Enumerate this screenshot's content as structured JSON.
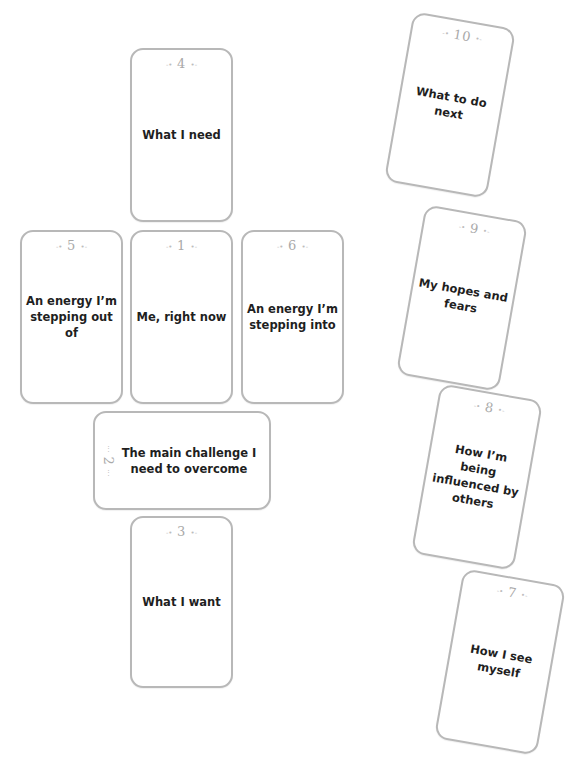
{
  "spread": {
    "cards": [
      {
        "position": "1",
        "label": "Me, right now"
      },
      {
        "position": "2",
        "label": "The main challenge I need to overcome"
      },
      {
        "position": "3",
        "label": "What I want"
      },
      {
        "position": "4",
        "label": "What I need"
      },
      {
        "position": "5",
        "label": "An energy I’m stepping out of"
      },
      {
        "position": "6",
        "label": "An energy I’m stepping into"
      },
      {
        "position": "7",
        "label": "How I see myself"
      },
      {
        "position": "8",
        "label": "How I’m being influenced by others"
      },
      {
        "position": "9",
        "label": "My hopes and fears"
      },
      {
        "position": "10",
        "label": "What to do next"
      }
    ],
    "ornament_left": "-•",
    "ornament_right": "•-",
    "colors": {
      "card_border": "#b8b8b8",
      "number": "#a9a9a9",
      "label": "#1f1f1f",
      "background": "#ffffff"
    }
  }
}
